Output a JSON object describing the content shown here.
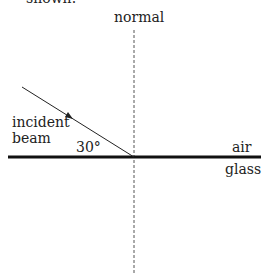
{
  "header_fragment": "shown.",
  "labels": {
    "normal": "normal",
    "incident_line1": "incident",
    "incident_line2": "beam",
    "angle": "30°",
    "air": "air",
    "glass": "glass"
  },
  "colors": {
    "line": "#111111",
    "normal": "#555555"
  }
}
